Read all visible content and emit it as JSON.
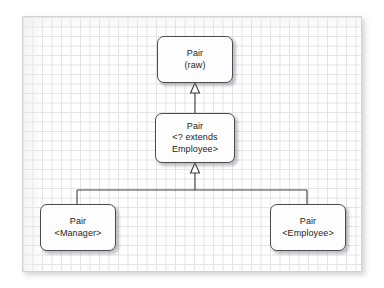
{
  "diagram": {
    "canvas": {
      "background_label": "graph-paper-grid",
      "grid_color": "#e3e3e6",
      "border_color": "#d2d2d5",
      "fill_color": "#ffffff"
    },
    "style": {
      "node_fill": "#fdfdfd",
      "node_border": "#4a4a4f",
      "connector_color": "#3c3c42",
      "text_color": "#1d1d20"
    },
    "nodes": [
      {
        "id": "raw",
        "name": "pair-raw",
        "lines": [
          "Pair",
          "(raw)"
        ]
      },
      {
        "id": "wildcard",
        "name": "pair-wildcard-extends-employee",
        "lines": [
          "Pair",
          "<? extends",
          "Employee>"
        ]
      },
      {
        "id": "manager",
        "name": "pair-manager",
        "lines": [
          "Pair",
          "<Manager>"
        ]
      },
      {
        "id": "employee",
        "name": "pair-employee",
        "lines": [
          "Pair",
          "<Employee>"
        ]
      }
    ],
    "edges": [
      {
        "id": "wildcard-to-raw",
        "from": "wildcard",
        "to": "raw",
        "kind": "generalization",
        "arrowhead": "hollow-triangle"
      },
      {
        "id": "manager-to-wildcard",
        "from": "manager",
        "to": "wildcard",
        "kind": "generalization",
        "arrowhead": "hollow-triangle"
      },
      {
        "id": "employee-to-wildcard",
        "from": "employee",
        "to": "wildcard",
        "kind": "generalization",
        "arrowhead": "hollow-triangle"
      }
    ]
  }
}
